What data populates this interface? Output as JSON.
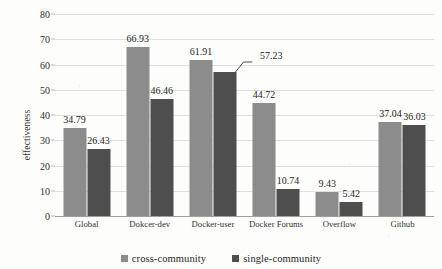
{
  "chart_data": {
    "type": "bar",
    "title": "",
    "xlabel": "",
    "ylabel": "effectiveness",
    "ylim": [
      0,
      80
    ],
    "yticks": [
      0,
      10,
      20,
      30,
      40,
      50,
      60,
      70,
      80
    ],
    "grid": true,
    "legend_position": "bottom",
    "categories": [
      "Global",
      "Dokcer-dev",
      "Docker-user",
      "Docker Forums",
      "Overflow",
      "Github"
    ],
    "series": [
      {
        "name": "cross-community",
        "color": "#8c8c8c",
        "values": [
          34.79,
          66.93,
          61.91,
          44.72,
          9.43,
          37.04
        ],
        "labels": [
          "34.79",
          "66.93",
          "61.91",
          "44.72",
          "9.43",
          "37.04"
        ]
      },
      {
        "name": "single-community",
        "color": "#4e4e4e",
        "values": [
          26.43,
          46.46,
          57.23,
          10.74,
          5.42,
          36.03
        ],
        "labels": [
          "26.43",
          "46.46",
          "57.23",
          "10.74",
          "5.42",
          "36.03"
        ]
      }
    ],
    "annotations": [
      {
        "text": "57.23",
        "target": "single-community/Docker-user",
        "style": "leader-line-offset-right"
      }
    ]
  },
  "axis": {
    "y_title": "effectiveness",
    "tick_labels": [
      "80",
      "70",
      "60",
      "50",
      "40",
      "30",
      "20",
      "10",
      "0"
    ],
    "x_tick_labels": [
      "Global",
      "Dokcer-dev",
      "Docker-user",
      "Docker Forums",
      "Overflow",
      "Github"
    ]
  },
  "legend": {
    "items": [
      {
        "label": "cross-community",
        "color": "#8c8c8c"
      },
      {
        "label": "single-community",
        "color": "#4e4e4e"
      }
    ]
  }
}
